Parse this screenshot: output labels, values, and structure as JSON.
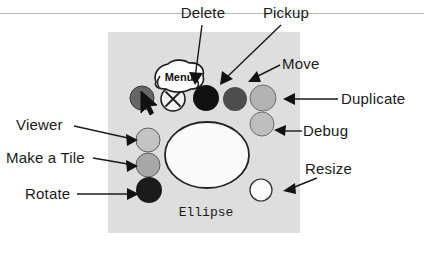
{
  "figure": {
    "title_rule": "",
    "canvas": {
      "background_color": "#ffffff",
      "panel_color": "#dedede",
      "panel_x": 108,
      "panel_y": 32,
      "panel_width": 192,
      "panel_height": 201
    }
  },
  "menu_bubble": {
    "label": "Menu"
  },
  "shape": {
    "name": "Ellipse"
  },
  "handles": {
    "cursor_handle": {
      "name": "menu-handle",
      "color": "#666666",
      "cx": 142,
      "cy": 98,
      "r": 12
    },
    "close_handle": {
      "name": "close-handle",
      "glyph": "X",
      "color": "#f2f2f2",
      "cx": 173,
      "cy": 99,
      "r": 12
    },
    "delete_handle": {
      "name": "delete-handle",
      "color": "#111111",
      "cx": 206,
      "cy": 98,
      "r": 13
    },
    "pickup_handle": {
      "name": "pickup-handle",
      "color": "#4d4d4d",
      "cx": 235,
      "cy": 99,
      "r": 12
    },
    "duplicate_handle": {
      "name": "duplicate-handle",
      "color": "#b3b3b3",
      "cx": 263,
      "cy": 98,
      "r": 13
    },
    "debug_handle": {
      "name": "debug-handle",
      "color": "#bdbdbd",
      "cx": 262,
      "cy": 124,
      "r": 12
    },
    "resize_handle": {
      "name": "resize-handle",
      "color": "#fbfbfb",
      "cx": 261,
      "cy": 190,
      "r": 11
    },
    "viewer_handle": {
      "name": "viewer-handle",
      "color": "#c4c4c4",
      "cx": 148,
      "cy": 140,
      "r": 12
    },
    "make_a_tile_handle": {
      "name": "make-a-tile-handle",
      "color": "#a8a8a8",
      "cx": 148,
      "cy": 165,
      "r": 12
    },
    "rotate_handle": {
      "name": "rotate-handle",
      "color": "#1a1a1a",
      "cx": 149,
      "cy": 190,
      "r": 13
    }
  },
  "ellipse_shape": {
    "cx": 207,
    "cy": 155,
    "rx": 42,
    "ry": 33,
    "fill": "#fafafa",
    "stroke": "#222222"
  },
  "callouts": [
    {
      "id": "delete",
      "label": "Delete",
      "text_x": 203,
      "text_y": 18,
      "anchor": "middle",
      "line_x1": 202,
      "line_y1": 25,
      "line_x2": 194,
      "line_y2": 79,
      "arrow_x": 194,
      "arrow_y": 82,
      "arrow_rot": 105
    },
    {
      "id": "pickup",
      "label": "Pickup",
      "text_x": 286,
      "text_y": 18,
      "anchor": "middle",
      "line_x1": 280,
      "line_y1": 25,
      "line_x2": 223,
      "line_y2": 79,
      "arrow_x": 221,
      "arrow_y": 82,
      "arrow_rot": 135
    },
    {
      "id": "move",
      "label": "Move",
      "text_x": 282,
      "text_y": 69,
      "anchor": "start",
      "line_x1": 279,
      "line_y1": 66,
      "line_x2": 253,
      "line_y2": 78,
      "arrow_x": 250,
      "arrow_y": 80,
      "arrow_rot": 155
    },
    {
      "id": "duplicate",
      "label": "Duplicate",
      "text_x": 341,
      "text_y": 104,
      "anchor": "start",
      "line_x1": 338,
      "line_y1": 99,
      "line_x2": 289,
      "line_y2": 99,
      "arrow_x": 284,
      "arrow_y": 99,
      "arrow_rot": 180
    },
    {
      "id": "debug",
      "label": "Debug",
      "text_x": 303,
      "text_y": 136,
      "anchor": "start",
      "line_x1": 300,
      "line_y1": 131,
      "line_x2": 281,
      "line_y2": 131,
      "arrow_x": 276,
      "arrow_y": 131,
      "arrow_rot": 180
    },
    {
      "id": "resize",
      "label": "Resize",
      "text_x": 305,
      "text_y": 174,
      "anchor": "start",
      "line_x1": 316,
      "line_y1": 178,
      "line_x2": 290,
      "line_y2": 189,
      "arrow_x": 286,
      "arrow_y": 190,
      "arrow_rot": 160
    },
    {
      "id": "viewer",
      "label": "Viewer",
      "text_x": 16,
      "text_y": 130,
      "anchor": "start",
      "line_x1": 75,
      "line_y1": 126,
      "line_x2": 129,
      "line_y2": 139,
      "arrow_x": 133,
      "arrow_y": 140,
      "arrow_rot": 10
    },
    {
      "id": "make-a-tile",
      "label": "Make a Tile",
      "text_x": 6,
      "text_y": 163,
      "anchor": "start",
      "line_x1": 93,
      "line_y1": 158,
      "line_x2": 129,
      "line_y2": 165,
      "arrow_x": 133,
      "arrow_y": 166,
      "arrow_rot": 8
    },
    {
      "id": "rotate",
      "label": "Rotate",
      "text_x": 25,
      "text_y": 199,
      "anchor": "start",
      "line_x1": 78,
      "line_y1": 194,
      "line_x2": 129,
      "line_y2": 194,
      "arrow_x": 134,
      "arrow_y": 194,
      "arrow_rot": 0
    }
  ],
  "cursor": {
    "name": "mouse-pointer"
  },
  "colors": {
    "panel": "#dedede",
    "line": "#1a1a1a",
    "rule": "#b9b9b9"
  }
}
